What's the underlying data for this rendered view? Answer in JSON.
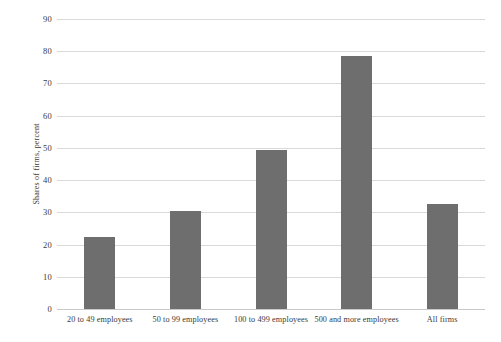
{
  "chart_data": {
    "type": "bar",
    "title": "",
    "subtitle": "",
    "xlabel": "",
    "ylabel": "Shares of firms, percent",
    "categories": [
      "20 to 49 employees",
      "50 to 99 employees",
      "100 to 499 employees",
      "500 and more employees",
      "All firms"
    ],
    "values": [
      22.5,
      30.5,
      49.3,
      78.5,
      32.5
    ],
    "ylim": [
      0,
      90
    ],
    "yticks": [
      0,
      10,
      20,
      30,
      40,
      50,
      60,
      70,
      80,
      90
    ],
    "ytick_labels": [
      "0",
      "10",
      "20",
      "30",
      "40",
      "50",
      "60",
      "70",
      "80",
      "90"
    ],
    "grid": true,
    "legend": false,
    "legend_position": "none",
    "bar_color": "#6e6e6e",
    "grid_color": "#d9d9d9",
    "background_color": "#ffffff",
    "text_color": "#3a3a3a"
  }
}
